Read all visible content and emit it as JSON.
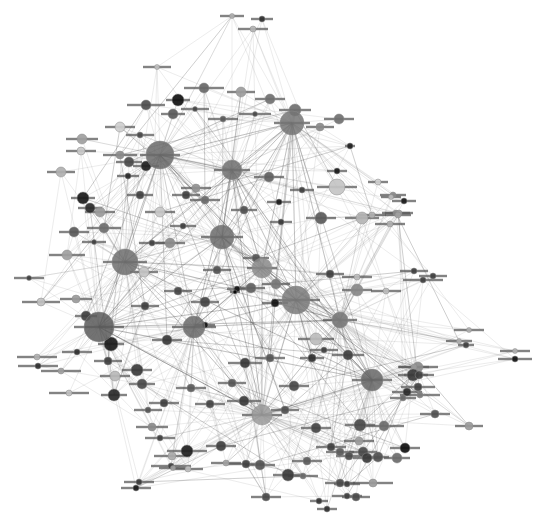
{
  "diagram": {
    "type": "network-graph",
    "background": "#ffffff",
    "label_note": "node labels rendered as small illegible text",
    "hubs": [
      {
        "x": 160,
        "y": 155,
        "r": 14,
        "color": "#6a6a6a",
        "lw": 40
      },
      {
        "x": 292,
        "y": 123,
        "r": 12,
        "color": "#747474",
        "lw": 36
      },
      {
        "x": 222,
        "y": 237,
        "r": 12,
        "color": "#6c6c6c",
        "lw": 42
      },
      {
        "x": 125,
        "y": 262,
        "r": 13,
        "color": "#6e6e6e",
        "lw": 44
      },
      {
        "x": 296,
        "y": 300,
        "r": 14,
        "color": "#7a7a7a",
        "lw": 48
      },
      {
        "x": 99,
        "y": 327,
        "r": 15,
        "color": "#5a5a5a",
        "lw": 50
      },
      {
        "x": 372,
        "y": 380,
        "r": 11,
        "color": "#666666",
        "lw": 40
      },
      {
        "x": 194,
        "y": 327,
        "r": 11,
        "color": "#6a6a6a",
        "lw": 44
      },
      {
        "x": 232,
        "y": 170,
        "r": 10,
        "color": "#707070",
        "lw": 36
      },
      {
        "x": 262,
        "y": 268,
        "r": 10,
        "color": "#8a8a8a",
        "lw": 30
      },
      {
        "x": 262,
        "y": 415,
        "r": 10,
        "color": "#9a9a9a",
        "lw": 40
      },
      {
        "x": 340,
        "y": 320,
        "r": 8,
        "color": "#7a7a7a",
        "lw": 34
      }
    ],
    "nodes": [
      {
        "x": 232,
        "y": 16,
        "r": 2.5,
        "color": "#b0b0b0",
        "lw": 24
      },
      {
        "x": 262,
        "y": 19,
        "r": 3,
        "color": "#303030",
        "lw": 22
      },
      {
        "x": 253,
        "y": 29,
        "r": 3,
        "color": "#b4b4b4",
        "lw": 30
      },
      {
        "x": 157,
        "y": 67,
        "r": 2.5,
        "color": "#c0c0c0",
        "lw": 28
      },
      {
        "x": 204,
        "y": 88,
        "r": 5,
        "color": "#686868",
        "lw": 40
      },
      {
        "x": 241,
        "y": 92,
        "r": 5,
        "color": "#9c9c9c",
        "lw": 28
      },
      {
        "x": 270,
        "y": 99,
        "r": 5,
        "color": "#707070",
        "lw": 30
      },
      {
        "x": 178,
        "y": 100,
        "r": 6,
        "color": "#111111",
        "lw": 24
      },
      {
        "x": 146,
        "y": 105,
        "r": 5,
        "color": "#4e4e4e",
        "lw": 38
      },
      {
        "x": 173,
        "y": 114,
        "r": 5,
        "color": "#5a5a5a",
        "lw": 24
      },
      {
        "x": 195,
        "y": 109,
        "r": 2.5,
        "color": "#444444",
        "lw": 28
      },
      {
        "x": 223,
        "y": 119,
        "r": 3,
        "color": "#5a5a5a",
        "lw": 30
      },
      {
        "x": 255,
        "y": 114,
        "r": 2.5,
        "color": "#4a4a4a",
        "lw": 32
      },
      {
        "x": 295,
        "y": 110,
        "r": 6,
        "color": "#707070",
        "lw": 32
      },
      {
        "x": 320,
        "y": 127,
        "r": 4,
        "color": "#8a8a8a",
        "lw": 28
      },
      {
        "x": 339,
        "y": 119,
        "r": 5,
        "color": "#707070",
        "lw": 30
      },
      {
        "x": 120,
        "y": 127,
        "r": 5,
        "color": "#cfcfcf",
        "lw": 30
      },
      {
        "x": 140,
        "y": 135,
        "r": 3,
        "color": "#4a4a4a",
        "lw": 28
      },
      {
        "x": 120,
        "y": 155,
        "r": 4,
        "color": "#8a8a8a",
        "lw": 34
      },
      {
        "x": 129,
        "y": 162,
        "r": 5,
        "color": "#4a4a4a",
        "lw": 26
      },
      {
        "x": 128,
        "y": 176,
        "r": 3,
        "color": "#2a2a2a",
        "lw": 22
      },
      {
        "x": 146,
        "y": 166,
        "r": 5,
        "color": "#202020",
        "lw": 26
      },
      {
        "x": 82,
        "y": 139,
        "r": 5,
        "color": "#a0a0a0",
        "lw": 32
      },
      {
        "x": 81,
        "y": 151,
        "r": 4,
        "color": "#c8c8c8",
        "lw": 30
      },
      {
        "x": 61,
        "y": 172,
        "r": 5,
        "color": "#b0b0b0",
        "lw": 28
      },
      {
        "x": 83,
        "y": 198,
        "r": 6,
        "color": "#1a1a1a",
        "lw": 24
      },
      {
        "x": 90,
        "y": 208,
        "r": 5,
        "color": "#2a2a2a",
        "lw": 24
      },
      {
        "x": 100,
        "y": 212,
        "r": 5,
        "color": "#9a9a9a",
        "lw": 30
      },
      {
        "x": 74,
        "y": 232,
        "r": 5,
        "color": "#5a5a5a",
        "lw": 30
      },
      {
        "x": 104,
        "y": 228,
        "r": 5,
        "color": "#6e6e6e",
        "lw": 34
      },
      {
        "x": 67,
        "y": 255,
        "r": 5,
        "color": "#a0a0a0",
        "lw": 36
      },
      {
        "x": 29,
        "y": 278,
        "r": 2.5,
        "color": "#404040",
        "lw": 30
      },
      {
        "x": 94,
        "y": 242,
        "r": 2.5,
        "color": "#404040",
        "lw": 24
      },
      {
        "x": 76,
        "y": 299,
        "r": 4,
        "color": "#9a9a9a",
        "lw": 32
      },
      {
        "x": 41,
        "y": 302,
        "r": 4,
        "color": "#c0c0c0",
        "lw": 38
      },
      {
        "x": 86,
        "y": 316,
        "r": 5,
        "color": "#404040",
        "lw": 22
      },
      {
        "x": 111,
        "y": 344,
        "r": 7,
        "color": "#1c1c1c",
        "lw": 26
      },
      {
        "x": 77,
        "y": 352,
        "r": 3,
        "color": "#303030",
        "lw": 30
      },
      {
        "x": 37,
        "y": 357,
        "r": 3,
        "color": "#b0b0b0",
        "lw": 40
      },
      {
        "x": 38,
        "y": 366,
        "r": 3,
        "color": "#303030",
        "lw": 40
      },
      {
        "x": 61,
        "y": 371,
        "r": 3,
        "color": "#a0a0a0",
        "lw": 40
      },
      {
        "x": 108,
        "y": 361,
        "r": 4,
        "color": "#404040",
        "lw": 28
      },
      {
        "x": 137,
        "y": 370,
        "r": 6,
        "color": "#3a3a3a",
        "lw": 30
      },
      {
        "x": 115,
        "y": 376,
        "r": 5,
        "color": "#b8b8b8",
        "lw": 30
      },
      {
        "x": 114,
        "y": 395,
        "r": 6,
        "color": "#2a2a2a",
        "lw": 26
      },
      {
        "x": 69,
        "y": 393,
        "r": 3,
        "color": "#c0c0c0",
        "lw": 40
      },
      {
        "x": 142,
        "y": 384,
        "r": 5,
        "color": "#4a4a4a",
        "lw": 26
      },
      {
        "x": 350,
        "y": 146,
        "r": 3,
        "color": "#202020",
        "lw": 10
      },
      {
        "x": 337,
        "y": 171,
        "r": 3,
        "color": "#1a1a1a",
        "lw": 20
      },
      {
        "x": 337,
        "y": 187,
        "r": 8,
        "color": "#c4c4c4",
        "lw": 40
      },
      {
        "x": 321,
        "y": 218,
        "r": 6,
        "color": "#5a5a5a",
        "lw": 30
      },
      {
        "x": 378,
        "y": 182,
        "r": 3,
        "color": "#cfcfcf",
        "lw": 20
      },
      {
        "x": 393,
        "y": 195,
        "r": 3,
        "color": "#8a8a8a",
        "lw": 26
      },
      {
        "x": 404,
        "y": 201,
        "r": 3,
        "color": "#1a1a1a",
        "lw": 24
      },
      {
        "x": 396,
        "y": 213,
        "r": 3,
        "color": "#8a8a8a",
        "lw": 28
      },
      {
        "x": 391,
        "y": 197,
        "r": 2.5,
        "color": "#bbbbbb",
        "lw": 20
      },
      {
        "x": 390,
        "y": 224,
        "r": 3,
        "color": "#b0b0b0",
        "lw": 30
      },
      {
        "x": 399,
        "y": 213,
        "r": 3,
        "color": "#9a9a9a",
        "lw": 28
      },
      {
        "x": 362,
        "y": 218,
        "r": 6,
        "color": "#b4b4b4",
        "lw": 34
      },
      {
        "x": 398,
        "y": 215,
        "r": 3,
        "color": "#a0a0a0",
        "lw": 26
      },
      {
        "x": 372,
        "y": 215,
        "r": 3,
        "color": "#b0b0b0",
        "lw": 28
      },
      {
        "x": 414,
        "y": 271,
        "r": 3,
        "color": "#404040",
        "lw": 28
      },
      {
        "x": 433,
        "y": 276,
        "r": 3,
        "color": "#404040",
        "lw": 28
      },
      {
        "x": 423,
        "y": 280,
        "r": 3,
        "color": "#404040",
        "lw": 40
      },
      {
        "x": 469,
        "y": 330,
        "r": 2.5,
        "color": "#b0b0b0",
        "lw": 30
      },
      {
        "x": 459,
        "y": 341,
        "r": 2.5,
        "color": "#b0b0b0",
        "lw": 26
      },
      {
        "x": 466,
        "y": 345,
        "r": 3,
        "color": "#404040",
        "lw": 16
      },
      {
        "x": 515,
        "y": 351,
        "r": 2.5,
        "color": "#b0b0b0",
        "lw": 30
      },
      {
        "x": 515,
        "y": 359,
        "r": 3,
        "color": "#151515",
        "lw": 34
      },
      {
        "x": 418,
        "y": 367,
        "r": 5,
        "color": "#8a8a8a",
        "lw": 40
      },
      {
        "x": 414,
        "y": 367,
        "r": 3,
        "color": "#9a9a9a",
        "lw": 30
      },
      {
        "x": 413,
        "y": 375,
        "r": 6,
        "color": "#3a3a3a",
        "lw": 30
      },
      {
        "x": 419,
        "y": 375,
        "r": 4,
        "color": "#404040",
        "lw": 30
      },
      {
        "x": 407,
        "y": 392,
        "r": 4,
        "color": "#2a2a2a",
        "lw": 30
      },
      {
        "x": 418,
        "y": 387,
        "r": 4,
        "color": "#404040",
        "lw": 34
      },
      {
        "x": 469,
        "y": 426,
        "r": 4,
        "color": "#9a9a9a",
        "lw": 28
      },
      {
        "x": 435,
        "y": 414,
        "r": 4,
        "color": "#505050",
        "lw": 30
      },
      {
        "x": 405,
        "y": 448,
        "r": 5,
        "color": "#101010",
        "lw": 30
      },
      {
        "x": 384,
        "y": 426,
        "r": 5,
        "color": "#6a6a6a",
        "lw": 40
      },
      {
        "x": 403,
        "y": 398,
        "r": 3,
        "color": "#6a6a6a",
        "lw": 26
      },
      {
        "x": 420,
        "y": 395,
        "r": 3,
        "color": "#7a7a7a",
        "lw": 40
      },
      {
        "x": 360,
        "y": 425,
        "r": 6,
        "color": "#4a4a4a",
        "lw": 30
      },
      {
        "x": 359,
        "y": 441,
        "r": 4,
        "color": "#9a9a9a",
        "lw": 30
      },
      {
        "x": 363,
        "y": 452,
        "r": 5,
        "color": "#4a4a4a",
        "lw": 28
      },
      {
        "x": 367,
        "y": 458,
        "r": 5,
        "color": "#3a3a3a",
        "lw": 28
      },
      {
        "x": 340,
        "y": 452,
        "r": 4,
        "color": "#5a5a5a",
        "lw": 28
      },
      {
        "x": 373,
        "y": 483,
        "r": 4,
        "color": "#9a9a9a",
        "lw": 40
      },
      {
        "x": 349,
        "y": 456,
        "r": 4,
        "color": "#4a4a4a",
        "lw": 26
      },
      {
        "x": 378,
        "y": 457,
        "r": 5,
        "color": "#505050",
        "lw": 22
      },
      {
        "x": 397,
        "y": 458,
        "r": 5,
        "color": "#6a6a6a",
        "lw": 26
      },
      {
        "x": 340,
        "y": 483,
        "r": 4,
        "color": "#4a4a4a",
        "lw": 30
      },
      {
        "x": 347,
        "y": 484,
        "r": 3,
        "color": "#404040",
        "lw": 26
      },
      {
        "x": 347,
        "y": 496,
        "r": 3,
        "color": "#404040",
        "lw": 30
      },
      {
        "x": 356,
        "y": 497,
        "r": 4,
        "color": "#4a4a4a",
        "lw": 28
      },
      {
        "x": 327,
        "y": 509,
        "r": 3,
        "color": "#303030",
        "lw": 20
      },
      {
        "x": 319,
        "y": 501,
        "r": 3,
        "color": "#353535",
        "lw": 18
      },
      {
        "x": 266,
        "y": 497,
        "r": 4,
        "color": "#4a4a4a",
        "lw": 30
      },
      {
        "x": 307,
        "y": 461,
        "r": 4,
        "color": "#5a5a5a",
        "lw": 30
      },
      {
        "x": 288,
        "y": 475,
        "r": 6,
        "color": "#3a3a3a",
        "lw": 30
      },
      {
        "x": 246,
        "y": 464,
        "r": 4,
        "color": "#404040",
        "lw": 36
      },
      {
        "x": 260,
        "y": 465,
        "r": 5,
        "color": "#555555",
        "lw": 30
      },
      {
        "x": 303,
        "y": 476,
        "r": 3,
        "color": "#6a6a6a",
        "lw": 30
      },
      {
        "x": 187,
        "y": 451,
        "r": 6,
        "color": "#202020",
        "lw": 40
      },
      {
        "x": 221,
        "y": 446,
        "r": 5,
        "color": "#404040",
        "lw": 30
      },
      {
        "x": 172,
        "y": 456,
        "r": 4,
        "color": "#aaaaaa",
        "lw": 36
      },
      {
        "x": 171,
        "y": 466,
        "r": 3,
        "color": "#404040",
        "lw": 40
      },
      {
        "x": 226,
        "y": 463,
        "r": 3,
        "color": "#a0a0a0",
        "lw": 30
      },
      {
        "x": 188,
        "y": 469,
        "r": 3,
        "color": "#bbbbbb",
        "lw": 30
      },
      {
        "x": 139,
        "y": 482,
        "r": 3,
        "color": "#3a3a3a",
        "lw": 30
      },
      {
        "x": 136,
        "y": 488,
        "r": 3,
        "color": "#1a1a1a",
        "lw": 30
      },
      {
        "x": 173,
        "y": 468,
        "r": 2.5,
        "color": "#a0a0a0",
        "lw": 28
      },
      {
        "x": 316,
        "y": 339,
        "r": 6,
        "color": "#bcbcbc",
        "lw": 36
      },
      {
        "x": 312,
        "y": 358,
        "r": 4,
        "color": "#303030",
        "lw": 24
      },
      {
        "x": 348,
        "y": 355,
        "r": 5,
        "color": "#404040",
        "lw": 32
      },
      {
        "x": 324,
        "y": 350,
        "r": 3,
        "color": "#404040",
        "lw": 28
      },
      {
        "x": 330,
        "y": 274,
        "r": 4,
        "color": "#404040",
        "lw": 28
      },
      {
        "x": 357,
        "y": 277,
        "r": 3,
        "color": "#bcbcbc",
        "lw": 30
      },
      {
        "x": 357,
        "y": 290,
        "r": 6,
        "color": "#888888",
        "lw": 30
      },
      {
        "x": 386,
        "y": 291,
        "r": 3,
        "color": "#bcbcbc",
        "lw": 30
      },
      {
        "x": 245,
        "y": 363,
        "r": 5,
        "color": "#3a3a3a",
        "lw": 34
      },
      {
        "x": 244,
        "y": 401,
        "r": 5,
        "color": "#3a3a3a",
        "lw": 34
      },
      {
        "x": 270,
        "y": 358,
        "r": 4,
        "color": "#555555",
        "lw": 30
      },
      {
        "x": 294,
        "y": 386,
        "r": 5,
        "color": "#4a4a4a",
        "lw": 30
      },
      {
        "x": 285,
        "y": 410,
        "r": 4,
        "color": "#505050",
        "lw": 28
      },
      {
        "x": 331,
        "y": 447,
        "r": 4,
        "color": "#404040",
        "lw": 30
      },
      {
        "x": 316,
        "y": 428,
        "r": 5,
        "color": "#444444",
        "lw": 30
      },
      {
        "x": 232,
        "y": 383,
        "r": 4,
        "color": "#555555",
        "lw": 28
      },
      {
        "x": 210,
        "y": 404,
        "r": 4,
        "color": "#444444",
        "lw": 30
      },
      {
        "x": 191,
        "y": 388,
        "r": 4,
        "color": "#5a5a5a",
        "lw": 30
      },
      {
        "x": 164,
        "y": 403,
        "r": 4,
        "color": "#404040",
        "lw": 30
      },
      {
        "x": 152,
        "y": 427,
        "r": 4,
        "color": "#8a8a8a",
        "lw": 32
      },
      {
        "x": 160,
        "y": 438,
        "r": 3,
        "color": "#404040",
        "lw": 30
      },
      {
        "x": 148,
        "y": 410,
        "r": 3,
        "color": "#555555",
        "lw": 28
      },
      {
        "x": 237,
        "y": 289,
        "r": 3,
        "color": "#151515",
        "lw": 20
      },
      {
        "x": 205,
        "y": 325,
        "r": 3,
        "color": "#151515",
        "lw": 20
      },
      {
        "x": 235,
        "y": 292,
        "r": 2,
        "color": "#000000",
        "lw": 10
      },
      {
        "x": 275,
        "y": 303,
        "r": 4,
        "color": "#151515",
        "lw": 26
      },
      {
        "x": 256,
        "y": 258,
        "r": 4,
        "color": "#555555",
        "lw": 26
      },
      {
        "x": 276,
        "y": 284,
        "r": 5,
        "color": "#777777",
        "lw": 28
      },
      {
        "x": 251,
        "y": 288,
        "r": 5,
        "color": "#606060",
        "lw": 28
      },
      {
        "x": 281,
        "y": 222,
        "r": 3,
        "color": "#3a3a3a",
        "lw": 22
      },
      {
        "x": 279,
        "y": 202,
        "r": 3,
        "color": "#1a1a1a",
        "lw": 24
      },
      {
        "x": 302,
        "y": 190,
        "r": 3,
        "color": "#404040",
        "lw": 24
      },
      {
        "x": 269,
        "y": 177,
        "r": 5,
        "color": "#606060",
        "lw": 30
      },
      {
        "x": 244,
        "y": 210,
        "r": 4,
        "color": "#505050",
        "lw": 26
      },
      {
        "x": 205,
        "y": 200,
        "r": 4,
        "color": "#6a6a6a",
        "lw": 30
      },
      {
        "x": 186,
        "y": 195,
        "r": 4,
        "color": "#404040",
        "lw": 28
      },
      {
        "x": 196,
        "y": 188,
        "r": 4,
        "color": "#909090",
        "lw": 30
      },
      {
        "x": 140,
        "y": 195,
        "r": 4,
        "color": "#404040",
        "lw": 26
      },
      {
        "x": 160,
        "y": 212,
        "r": 5,
        "color": "#c8c8c8",
        "lw": 30
      },
      {
        "x": 170,
        "y": 243,
        "r": 5,
        "color": "#8a8a8a",
        "lw": 30
      },
      {
        "x": 152,
        "y": 243,
        "r": 3,
        "color": "#404040",
        "lw": 26
      },
      {
        "x": 144,
        "y": 272,
        "r": 5,
        "color": "#c4c4c4",
        "lw": 28
      },
      {
        "x": 178,
        "y": 291,
        "r": 4,
        "color": "#454545",
        "lw": 28
      },
      {
        "x": 145,
        "y": 306,
        "r": 4,
        "color": "#404040",
        "lw": 28
      },
      {
        "x": 167,
        "y": 340,
        "r": 5,
        "color": "#3a3a3a",
        "lw": 30
      },
      {
        "x": 205,
        "y": 302,
        "r": 5,
        "color": "#454545",
        "lw": 28
      },
      {
        "x": 217,
        "y": 270,
        "r": 4,
        "color": "#505050",
        "lw": 28
      },
      {
        "x": 183,
        "y": 226,
        "r": 3,
        "color": "#404040",
        "lw": 26
      }
    ]
  }
}
